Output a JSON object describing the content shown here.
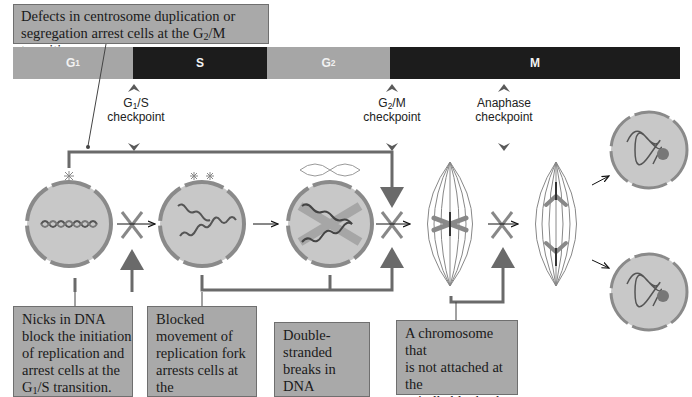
{
  "title_callout": {
    "line1": "Defects in centrosome duplication or",
    "line2_pre": "segregation arrest cells at the G",
    "line2_sub": "2",
    "line2_post": "/M transition."
  },
  "phase_bar": {
    "phases": [
      {
        "label": "G",
        "sub": "1",
        "color": "#a6a6a6"
      },
      {
        "label": "S",
        "sub": "",
        "color": "#1c1c1c"
      },
      {
        "label": "G",
        "sub": "2",
        "color": "#a6a6a6"
      },
      {
        "label": "M",
        "sub": "",
        "color": "#1c1c1c"
      }
    ]
  },
  "checkpoints": [
    {
      "name_pre": "G",
      "name_sub": "1",
      "name_post": "/S",
      "line2": "checkpoint"
    },
    {
      "name_pre": "G",
      "name_sub": "2",
      "name_post": "/M",
      "line2": "checkpoint"
    },
    {
      "name_pre": "Anaphase",
      "name_sub": "",
      "name_post": "",
      "line2": "checkpoint"
    }
  ],
  "bottom_callouts": [
    {
      "lines": [
        "Nicks in DNA",
        "block the initiation",
        "of replication and",
        "arrest cells at the"
      ],
      "last_pre": "G",
      "last_sub": "1",
      "last_post": "/S transition."
    },
    {
      "lines": [
        "Blocked",
        "movement of",
        "replication fork",
        "arrests cells at the"
      ],
      "last_pre": "G",
      "last_sub": "2",
      "last_post": "/M transition."
    },
    {
      "lines": [
        "Double-stranded",
        "breaks in DNA",
        "arrest cells at the"
      ],
      "last_pre": "G",
      "last_sub": "2",
      "last_post": "/M transition."
    },
    {
      "lines": [
        "A chromosome that",
        "is not attached at the",
        "spindle blocks the",
        "onset of anaphase."
      ],
      "last_pre": "",
      "last_sub": "",
      "last_post": ""
    }
  ],
  "colors": {
    "callout_fill": "#a9a9a9",
    "cell_fill": "#c8c8c8",
    "cell_border": "#8a8a8a",
    "arrow_gray": "#6a6a6a",
    "dark_phase": "#1c1c1c",
    "light_phase": "#a6a6a6"
  }
}
